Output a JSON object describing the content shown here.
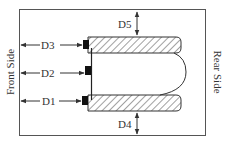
{
  "diagram": {
    "side_labels": {
      "front": "Front Side",
      "rear": "Rear Side"
    },
    "dimensions": [
      {
        "id": "D1",
        "label": "D1"
      },
      {
        "id": "D2",
        "label": "D2"
      },
      {
        "id": "D3",
        "label": "D3"
      },
      {
        "id": "D4",
        "label": "D4"
      },
      {
        "id": "D5",
        "label": "D5"
      }
    ],
    "colors": {
      "line": "#333333",
      "hatch": "#444444",
      "marker": "#111111",
      "background": "#ffffff"
    }
  }
}
